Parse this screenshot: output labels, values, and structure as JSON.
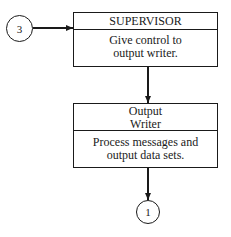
{
  "diagram": {
    "connector_in": {
      "label": "3"
    },
    "connector_out": {
      "label": "1"
    },
    "boxes": [
      {
        "title": "SUPERVISOR",
        "body": [
          "Give control to",
          "output writer."
        ]
      },
      {
        "title": [
          "Output",
          "Writer"
        ],
        "body": [
          "Process messages and",
          "output data sets."
        ]
      }
    ]
  }
}
